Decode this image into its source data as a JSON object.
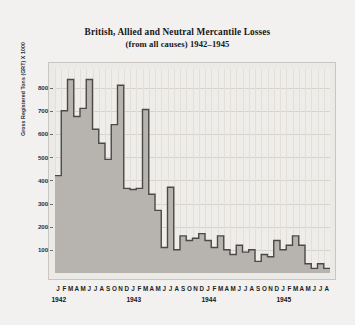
{
  "chart_data": {
    "type": "area",
    "title": "British, Allied and Neutral Mercantile Losses",
    "subtitle": "(from all causes) 1942–1945",
    "xlabel": "",
    "ylabel": "Gross Registered Tons (GRT) X 1000",
    "ylim": [
      0,
      880
    ],
    "yticks": [
      100,
      200,
      300,
      400,
      500,
      600,
      700,
      800
    ],
    "grid": true,
    "legend": null,
    "step_style": "step-post",
    "area_fill": "#b7b4b0",
    "line_color": "#4c4a49",
    "plot_background": "#efedea",
    "page_background": "#f2f1ef",
    "month_letters": [
      "J",
      "F",
      "M",
      "A",
      "M",
      "J",
      "J",
      "A",
      "S",
      "O",
      "N",
      "D"
    ],
    "years": [
      "1942",
      "1943",
      "1944",
      "1945"
    ],
    "x": [
      "1942-01",
      "1942-02",
      "1942-03",
      "1942-04",
      "1942-05",
      "1942-06",
      "1942-07",
      "1942-08",
      "1942-09",
      "1942-10",
      "1942-11",
      "1942-12",
      "1943-01",
      "1943-02",
      "1943-03",
      "1943-04",
      "1943-05",
      "1943-06",
      "1943-07",
      "1943-08",
      "1943-09",
      "1943-10",
      "1943-11",
      "1943-12",
      "1944-01",
      "1944-02",
      "1944-03",
      "1944-04",
      "1944-05",
      "1944-06",
      "1944-07",
      "1944-08",
      "1944-09",
      "1944-10",
      "1944-11",
      "1944-12",
      "1945-01",
      "1945-02",
      "1945-03",
      "1945-04",
      "1945-05",
      "1945-06",
      "1945-07",
      "1945-08"
    ],
    "categories": [
      "J",
      "F",
      "M",
      "A",
      "M",
      "J",
      "J",
      "A",
      "S",
      "O",
      "N",
      "D",
      "J",
      "F",
      "M",
      "A",
      "M",
      "J",
      "J",
      "A",
      "S",
      "O",
      "N",
      "D",
      "J",
      "F",
      "M",
      "A",
      "M",
      "J",
      "J",
      "A",
      "S",
      "O",
      "N",
      "D",
      "J",
      "F",
      "M",
      "A",
      "M",
      "J",
      "J",
      "A"
    ],
    "values": [
      420,
      700,
      835,
      675,
      710,
      835,
      620,
      560,
      490,
      640,
      810,
      365,
      360,
      365,
      705,
      340,
      270,
      110,
      370,
      100,
      160,
      140,
      150,
      170,
      140,
      110,
      160,
      100,
      80,
      120,
      90,
      100,
      50,
      80,
      70,
      140,
      100,
      120,
      160,
      120,
      40,
      20,
      40,
      20
    ],
    "series": [
      {
        "name": "Mercantile losses (GRT x 1000)",
        "values": [
          420,
          700,
          835,
          675,
          710,
          835,
          620,
          560,
          490,
          640,
          810,
          365,
          360,
          365,
          705,
          340,
          270,
          110,
          370,
          100,
          160,
          140,
          150,
          170,
          140,
          110,
          160,
          100,
          80,
          120,
          90,
          100,
          50,
          80,
          70,
          140,
          100,
          120,
          160,
          120,
          40,
          20,
          40,
          20
        ]
      }
    ]
  }
}
